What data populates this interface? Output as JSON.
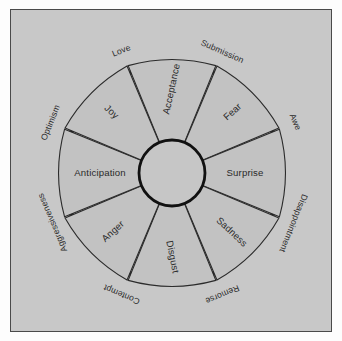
{
  "figure": {
    "background_color": "#c8c8c8",
    "segment_fill": "#c2c2c2",
    "outline_color": "#111111",
    "text_color": "#2a2a2a"
  },
  "chart_data": {
    "type": "pie",
    "xlabel": "",
    "ylabel": "",
    "legend": "none",
    "grid": false,
    "center_label": "",
    "rings": [
      {
        "name": "primary_emotions",
        "count": 8,
        "slice_value": 45,
        "categories": [
          "Acceptance",
          "Fear",
          "Surprise",
          "Sadness",
          "Disgust",
          "Anger",
          "Anticipation",
          "Joy"
        ],
        "values": [
          45,
          45,
          45,
          45,
          45,
          45,
          45,
          45
        ]
      },
      {
        "name": "dyads",
        "count": 8,
        "categories": [
          "Submission",
          "Awe",
          "Disappointment",
          "Remorse",
          "Contempt",
          "Aggressiveness",
          "Optimism",
          "Love"
        ],
        "values": [
          1,
          1,
          1,
          1,
          1,
          1,
          1,
          1
        ]
      }
    ]
  },
  "wedges": [
    {
      "label": "Acceptance",
      "angle_deg": -90,
      "rotate": -78,
      "r": 84
    },
    {
      "label": "Fear",
      "angle_deg": -45,
      "rotate": -42,
      "r": 86
    },
    {
      "label": "Surprise",
      "angle_deg": 0,
      "rotate": 0,
      "r": 73
    },
    {
      "label": "Sadness",
      "angle_deg": 45,
      "rotate": 43,
      "r": 84
    },
    {
      "label": "Disgust",
      "angle_deg": 90,
      "rotate": 79,
      "r": 84
    },
    {
      "label": "Anger",
      "angle_deg": 135,
      "rotate": -42,
      "r": 83
    },
    {
      "label": "Anticipation",
      "angle_deg": 180,
      "rotate": 0,
      "r": 72
    },
    {
      "label": "Joy",
      "angle_deg": -135,
      "rotate": 43,
      "r": 86
    }
  ],
  "petals": [
    {
      "label": "Submission",
      "angle_deg": -67.5,
      "rotate": 24,
      "r": 131
    },
    {
      "label": "Awe",
      "angle_deg": -22.5,
      "rotate": 67,
      "r": 133
    },
    {
      "label": "Disappointment",
      "angle_deg": 22.5,
      "rotate": 112,
      "r": 131
    },
    {
      "label": "Remorse",
      "angle_deg": 67.5,
      "rotate": 157,
      "r": 131
    },
    {
      "label": "Contempt",
      "angle_deg": 112.5,
      "rotate": -157,
      "r": 131
    },
    {
      "label": "Aggressiveness",
      "angle_deg": 157.5,
      "rotate": -113,
      "r": 129
    },
    {
      "label": "Optimism",
      "angle_deg": -157.5,
      "rotate": -68,
      "r": 131
    },
    {
      "label": "Love",
      "angle_deg": -112.5,
      "rotate": -22,
      "r": 132
    }
  ]
}
